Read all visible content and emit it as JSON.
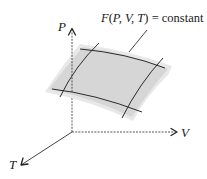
{
  "diagram": {
    "type": "3d-surface-sketch",
    "surface_label": {
      "func": "F",
      "open": "(",
      "args": "P, V, T",
      "close": ")",
      "equals": " = constant",
      "full_text": "F(P, V, T) = constant"
    },
    "axes": [
      {
        "name": "P",
        "direction": "up"
      },
      {
        "name": "V",
        "direction": "right"
      },
      {
        "name": "T",
        "direction": "down-left"
      }
    ],
    "colors": {
      "surface_fill": "#d9d9d9",
      "surface_edge": "#e6e6e6",
      "curve_stroke": "#2b2b2b",
      "axis_stroke": "#333333",
      "text": "#1a1a1a"
    }
  }
}
